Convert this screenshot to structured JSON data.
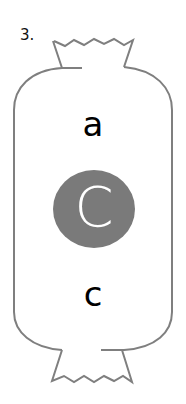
{
  "item_number": "3.",
  "candy": {
    "outline_color": "#7f7f7f",
    "top_letter": "a",
    "highlight_letter": "C",
    "highlight_color": "#7a7a7a",
    "bottom_letter": "c"
  }
}
